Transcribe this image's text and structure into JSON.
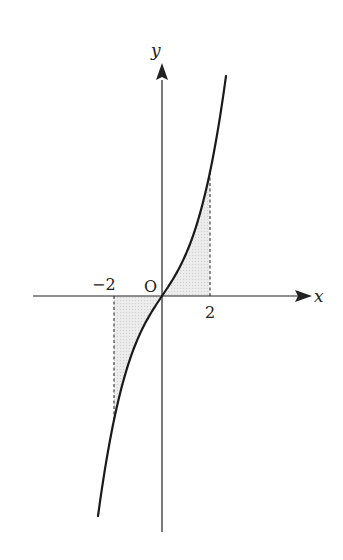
{
  "chart_data": {
    "type": "line",
    "title": "",
    "xlabel": "x",
    "ylabel": "y",
    "origin_label": "O",
    "x_ticks": [
      {
        "value": -2,
        "label": "−2"
      },
      {
        "value": 2,
        "label": "2"
      }
    ],
    "series": [
      {
        "name": "increasing odd cubic curve through origin",
        "function_form": "y = a x^3 + b x (odd, increasing)",
        "x": [
          -2.67,
          -2,
          -1,
          0,
          1,
          2,
          2.67
        ],
        "y": [
          -9.1,
          -5.1,
          -1.7,
          0,
          1.7,
          5.1,
          9.1
        ]
      }
    ],
    "shaded_regions": [
      {
        "from_x": -2,
        "to_x": 0,
        "between": "curve and x-axis",
        "fill": "#e6e6e6"
      },
      {
        "from_x": 0,
        "to_x": 2,
        "between": "curve and x-axis",
        "fill": "#e6e6e6"
      }
    ],
    "dashed_lines": [
      {
        "x": -2,
        "from": "x-axis",
        "to": "curve"
      },
      {
        "x": 2,
        "from": "x-axis",
        "to": "curve"
      }
    ],
    "grid": false,
    "legend": null
  },
  "labels": {
    "x_axis": "x",
    "y_axis": "y",
    "origin": "O",
    "tick_neg2": "−2",
    "tick_pos2": "2"
  },
  "colors": {
    "ink": "#222222",
    "shade": "#e6e6e6",
    "background": "#ffffff"
  }
}
